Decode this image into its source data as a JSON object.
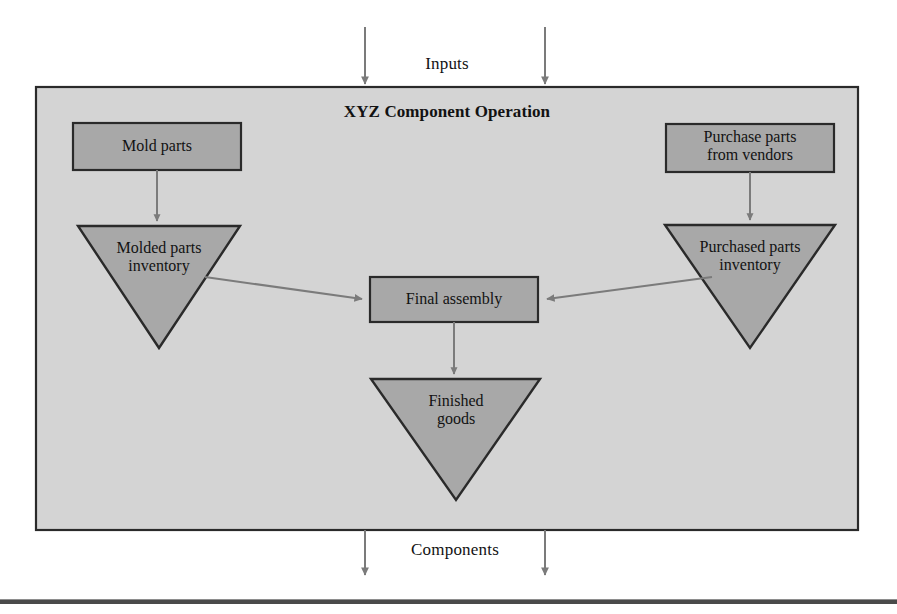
{
  "figure": {
    "type": "process-flow-diagram",
    "background_color": "#ffffff",
    "container_fill": "#d4d4d4",
    "node_fill": "#a8a8a8",
    "border_color": "#2a2a2a",
    "arrow_color": "#7b7b7b",
    "rule_color": "#4a4a4a"
  },
  "inputs": {
    "label": "Inputs"
  },
  "outputs": {
    "label": "Components"
  },
  "operation": {
    "title": "XYZ Component Operation"
  },
  "nodes": {
    "mold_parts": {
      "label": "Mold parts",
      "shape": "rectangle"
    },
    "purchase_parts": {
      "label": "Purchase parts\nfrom vendors",
      "shape": "rectangle"
    },
    "molded_inventory": {
      "label": "Molded parts\ninventory",
      "shape": "inverted-triangle"
    },
    "purchased_inventory": {
      "label": "Purchased parts\ninventory",
      "shape": "inverted-triangle"
    },
    "final_assembly": {
      "label": "Final assembly",
      "shape": "rectangle"
    },
    "finished_goods": {
      "label": "Finished\ngoods",
      "shape": "inverted-triangle"
    }
  }
}
